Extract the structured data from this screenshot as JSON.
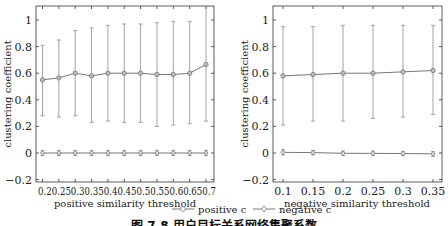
{
  "chart_data": [
    {
      "type": "line",
      "title": "",
      "xlabel": "positive similarity threshold",
      "ylabel": "clustering coefficient",
      "ylim": [
        -0.2,
        1.1
      ],
      "yticks": [
        "-0.2",
        "0",
        "0.2",
        "0.4",
        "0.6",
        "0.8",
        "1"
      ],
      "x": [
        0.2,
        0.25,
        0.3,
        0.35,
        0.4,
        0.45,
        0.5,
        0.55,
        0.6,
        0.65,
        0.7
      ],
      "xtick_labels": [
        "0.2",
        "0.25",
        "0.3",
        "0.35",
        "0.4",
        "0.45",
        "0.5",
        "0.55",
        "0.6",
        "0.65",
        "0.7"
      ],
      "grid": false,
      "series": [
        {
          "name": "positive c",
          "marker": "circle",
          "values": [
            0.55,
            0.565,
            0.6,
            0.58,
            0.6,
            0.6,
            0.6,
            0.59,
            0.59,
            0.6,
            0.665
          ],
          "err_low": [
            0.28,
            0.27,
            0.28,
            0.23,
            0.24,
            0.23,
            0.23,
            0.2,
            0.21,
            0.22,
            0.24
          ],
          "err_high": [
            0.81,
            0.85,
            0.92,
            0.94,
            0.96,
            0.97,
            0.97,
            0.98,
            0.99,
            0.99,
            1.1
          ]
        },
        {
          "name": "negative c",
          "marker": "diamond",
          "values": [
            0,
            0,
            0,
            0,
            0,
            0,
            0,
            0,
            0,
            0,
            0
          ],
          "err_low": [
            -0.02,
            -0.02,
            -0.02,
            -0.02,
            -0.02,
            -0.02,
            -0.02,
            -0.02,
            -0.02,
            -0.02,
            -0.02
          ],
          "err_high": [
            0.02,
            0.02,
            0.02,
            0.02,
            0.02,
            0.02,
            0.02,
            0.02,
            0.02,
            0.02,
            0.02
          ]
        }
      ]
    },
    {
      "type": "line",
      "title": "",
      "xlabel": "negative similarity threshold",
      "ylabel": "clustering coefficient",
      "ylim": [
        -0.2,
        1.1
      ],
      "yticks": [
        "-0.2",
        "0",
        "0.2",
        "0.4",
        "0.6",
        "0.8",
        "1"
      ],
      "x": [
        0.1,
        0.15,
        0.2,
        0.25,
        0.3,
        0.35
      ],
      "xtick_labels": [
        "0.1",
        "0.15",
        "0.2",
        "0.25",
        "0.3",
        "0.35"
      ],
      "grid": false,
      "series": [
        {
          "name": "positive c",
          "marker": "circle",
          "values": [
            0.58,
            0.59,
            0.6,
            0.6,
            0.61,
            0.62
          ],
          "err_low": [
            0.21,
            0.24,
            0.24,
            0.26,
            0.27,
            0.29
          ],
          "err_high": [
            0.95,
            0.95,
            0.96,
            0.96,
            0.96,
            0.96
          ]
        },
        {
          "name": "negative c",
          "marker": "diamond",
          "values": [
            0.005,
            0.003,
            -0.002,
            -0.003,
            -0.004,
            -0.006
          ],
          "err_low": [
            -0.015,
            -0.015,
            -0.02,
            -0.02,
            -0.02,
            -0.025
          ],
          "err_high": [
            0.025,
            0.02,
            0.015,
            0.015,
            0.012,
            0.01
          ]
        }
      ]
    }
  ],
  "legend": {
    "items": [
      {
        "label": "positive c",
        "marker": "circle"
      },
      {
        "label": "negative c",
        "marker": "diamond"
      }
    ],
    "position": "bottom-center"
  },
  "caption": "图 7.8  用户目标关系网络集聚系数",
  "colors": {
    "line": "#777777",
    "axis": "#333333",
    "error_bar": "#999999"
  }
}
